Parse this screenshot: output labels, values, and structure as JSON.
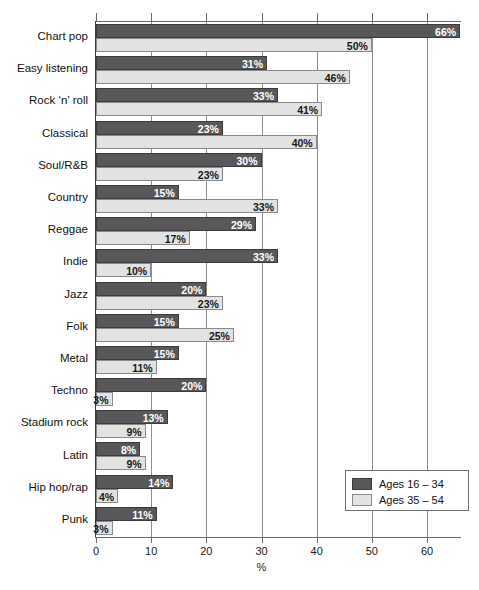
{
  "chart_data": {
    "type": "bar",
    "orientation": "horizontal",
    "title": "",
    "xlabel": "%",
    "ylabel": "",
    "xlim": [
      0,
      66
    ],
    "xticks": [
      0,
      10,
      20,
      30,
      40,
      50,
      60
    ],
    "xtick_labels": [
      "0",
      "10",
      "20",
      "30",
      "40",
      "50",
      "60"
    ],
    "grid": true,
    "grid_axis": "x",
    "legend_position": "bottom-right",
    "categories": [
      "Chart pop",
      "Easy listening",
      "Rock ‘n’ roll",
      "Classical",
      "Soul/R&B",
      "Country",
      "Reggae",
      "Indie",
      "Jazz",
      "Folk",
      "Metal",
      "Techno",
      "Stadium rock",
      "Latin",
      "Hip hop/rap",
      "Punk"
    ],
    "series": [
      {
        "name": "Ages 16 – 34",
        "color": "#58585a",
        "values": [
          66,
          31,
          33,
          23,
          30,
          15,
          29,
          33,
          20,
          15,
          15,
          20,
          13,
          8,
          14,
          11
        ],
        "value_labels": [
          "66%",
          "31%",
          "33%",
          "23%",
          "30%",
          "15%",
          "29%",
          "33%",
          "20%",
          "15%",
          "15%",
          "20%",
          "13%",
          "8%",
          "14%",
          "11%"
        ]
      },
      {
        "name": "Ages 35 – 54",
        "color": "#e2e2e2",
        "values": [
          50,
          46,
          41,
          40,
          23,
          33,
          17,
          10,
          23,
          25,
          11,
          3,
          9,
          9,
          4,
          3
        ],
        "value_labels": [
          "50%",
          "46%",
          "41%",
          "40%",
          "23%",
          "33%",
          "17%",
          "10%",
          "23%",
          "25%",
          "11%",
          "3%",
          "9%",
          "9%",
          "4%",
          "3%"
        ]
      }
    ]
  },
  "legend": {
    "items": [
      {
        "label": "Ages 16 – 34",
        "swatch": "dark-gray-swatch"
      },
      {
        "label": "Ages 35 – 54",
        "swatch": "light-gray-swatch"
      }
    ]
  }
}
